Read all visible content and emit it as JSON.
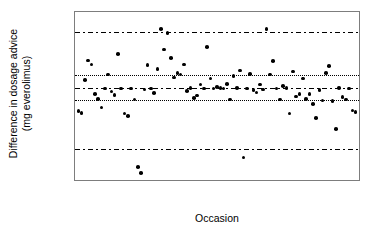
{
  "chart_data": {
    "type": "scatter",
    "title": "",
    "xlabel": "Occasion",
    "ylabel_line1": "Difference in dosage advice",
    "ylabel_line2": "(mg everolimus)",
    "xlim": [
      0,
      86
    ],
    "ylim": [
      -1.15,
      1.0
    ],
    "grid": false,
    "xticks": [
      10,
      20,
      30,
      40,
      50,
      60,
      70,
      80
    ],
    "xtick_labels": [
      "10",
      "20",
      "30",
      "40",
      "50",
      "60",
      "70",
      "80"
    ],
    "yticks": [
      0.75,
      0.25,
      -0.25,
      -0.75
    ],
    "ytick_labels": [
      "0.75",
      "0.25",
      "−0.25",
      "−0.75"
    ],
    "yticks_minor": [
      0.5,
      0.0,
      -0.5
    ],
    "reference_lines": [
      {
        "name": "upper-limit-of-agreement",
        "y": 0.75,
        "style": "dashdot"
      },
      {
        "name": "upper-ci",
        "y": 0.2,
        "style": "dotted"
      },
      {
        "name": "mean-bias",
        "y": 0.03,
        "style": "dashdot"
      },
      {
        "name": "lower-ci",
        "y": -0.13,
        "style": "dotted"
      },
      {
        "name": "lower-limit-of-agreement",
        "y": -0.75,
        "style": "dashdot"
      }
    ],
    "series": [
      {
        "name": "dosage-difference",
        "marker": "filled-circle",
        "color": "#000000",
        "points": [
          [
            1,
            -0.27
          ],
          [
            2,
            -0.29
          ],
          [
            3,
            0.13
          ],
          [
            4,
            0.38
          ],
          [
            5,
            0.33
          ],
          [
            6,
            -0.05
          ],
          [
            7,
            -0.11
          ],
          [
            8,
            -0.22
          ],
          [
            9,
            0.02
          ],
          [
            10,
            0.2
          ],
          [
            11,
            -0.02
          ],
          [
            12,
            -0.06
          ],
          [
            13,
            0.46
          ],
          [
            14,
            0.02
          ],
          [
            15,
            -0.3
          ],
          [
            16,
            -0.33
          ],
          [
            17,
            0.02
          ],
          [
            18,
            -0.12
          ],
          [
            19,
            -0.98
          ],
          [
            20,
            -1.06
          ],
          [
            21,
            0.01
          ],
          [
            22,
            0.32
          ],
          [
            23,
            0.02
          ],
          [
            24,
            -0.04
          ],
          [
            25,
            0.27
          ],
          [
            26,
            0.78
          ],
          [
            27,
            0.52
          ],
          [
            28,
            0.73
          ],
          [
            29,
            0.41
          ],
          [
            30,
            0.16
          ],
          [
            31,
            0.22
          ],
          [
            32,
            0.2
          ],
          [
            33,
            0.33
          ],
          [
            34,
            -0.01
          ],
          [
            35,
            0.03
          ],
          [
            36,
            -0.1
          ],
          [
            37,
            -0.07
          ],
          [
            38,
            0.07
          ],
          [
            39,
            0.02
          ],
          [
            40,
            0.55
          ],
          [
            41,
            0.15
          ],
          [
            42,
            0.02
          ],
          [
            43,
            0.04
          ],
          [
            44,
            0.03
          ],
          [
            45,
            0.02
          ],
          [
            46,
            0.08
          ],
          [
            47,
            -0.12
          ],
          [
            48,
            0.18
          ],
          [
            49,
            0.03
          ],
          [
            50,
            0.25
          ],
          [
            51,
            -0.86
          ],
          [
            52,
            0.02
          ],
          [
            53,
            0.21
          ],
          [
            54,
            0.0
          ],
          [
            55,
            -0.03
          ],
          [
            56,
            0.07
          ],
          [
            57,
            0.01
          ],
          [
            58,
            0.78
          ],
          [
            59,
            0.2
          ],
          [
            60,
            0.37
          ],
          [
            61,
            0.02
          ],
          [
            62,
            -0.12
          ],
          [
            63,
            0.05
          ],
          [
            64,
            0.03
          ],
          [
            65,
            -0.3
          ],
          [
            66,
            0.24
          ],
          [
            67,
            -0.08
          ],
          [
            68,
            -0.05
          ],
          [
            69,
            0.15
          ],
          [
            70,
            -0.11
          ],
          [
            71,
            -0.05
          ],
          [
            72,
            -0.18
          ],
          [
            73,
            -0.36
          ],
          [
            74,
            0.0
          ],
          [
            75,
            -0.13
          ],
          [
            76,
            0.22
          ],
          [
            77,
            0.31
          ],
          [
            78,
            -0.14
          ],
          [
            79,
            -0.5
          ],
          [
            80,
            0.03
          ],
          [
            81,
            -0.09
          ],
          [
            82,
            -0.12
          ],
          [
            83,
            0.02
          ],
          [
            84,
            -0.26
          ],
          [
            85,
            -0.28
          ]
        ]
      }
    ]
  }
}
